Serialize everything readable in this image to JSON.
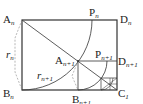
{
  "diagram": {
    "type": "geometry",
    "labels": {
      "A_n": {
        "base": "A",
        "sub": "n"
      },
      "B_n": {
        "base": "B",
        "sub": "n"
      },
      "C_1": {
        "base": "C",
        "sub": "1"
      },
      "D_n": {
        "base": "D",
        "sub": "n"
      },
      "P_n": {
        "base": "P",
        "sub": "n"
      },
      "A_n1": {
        "base": "A",
        "sub": "n+1"
      },
      "B_n1": {
        "base": "B",
        "sub": "n+1"
      },
      "D_n1": {
        "base": "D",
        "sub": "n+1"
      },
      "P_n1": {
        "base": "P",
        "sub": "n+1"
      },
      "r_n": {
        "base": "r",
        "sub": "n"
      },
      "r_n1": {
        "base": "r",
        "sub": "n+1"
      }
    },
    "colors": {
      "line": "#333333",
      "dashed": "#888888"
    }
  }
}
